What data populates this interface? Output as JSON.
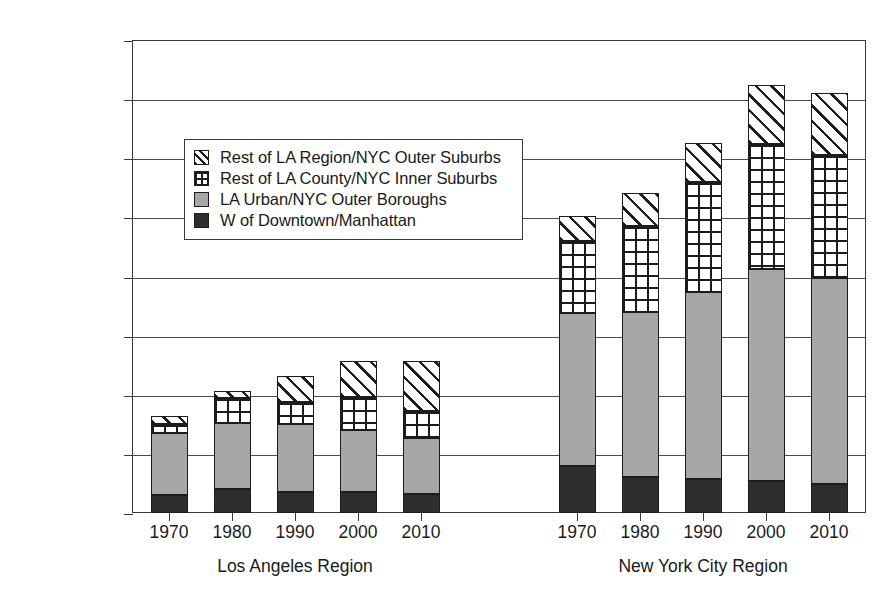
{
  "chart_data": {
    "type": "bar",
    "subtype": "stacked",
    "title": "",
    "xlabel": "",
    "ylabel": "",
    "ylim": [
      0,
      4000000
    ],
    "ytick_values": [
      0,
      500000,
      1000000,
      1500000,
      2000000,
      2500000,
      3000000,
      3500000,
      4000000
    ],
    "ytick_labels": [
      "0",
      "500,000",
      "1,000,000",
      "1,500,000",
      "2,000,000",
      "2,500,000",
      "3,000,000",
      "3,500,000",
      "4,000,000"
    ],
    "grid": true,
    "grid_axis": "y",
    "legend_position": "upper-left-inside",
    "categories": [
      "1970",
      "1980",
      "1990",
      "2000",
      "2010"
    ],
    "groups": [
      {
        "name": "Los Angeles Region",
        "categories": [
          "1970",
          "1980",
          "1990",
          "2000",
          "2010"
        ]
      },
      {
        "name": "New York City Region",
        "categories": [
          "1970",
          "1980",
          "1990",
          "2000",
          "2010"
        ]
      }
    ],
    "series": [
      {
        "name": "W of Downtown/Manhattan",
        "pattern": "solid-dark",
        "color": "#2e2e2e",
        "values": {
          "Los Angeles Region": [
            152000,
            203000,
            178000,
            178000,
            161000
          ],
          "New York City Region": [
            398000,
            305000,
            288000,
            271000,
            246000
          ]
        }
      },
      {
        "name": "LA Urban/NYC Outer Boroughs",
        "pattern": "solid-gray",
        "color": "#a6a6a6",
        "values": {
          "Los Angeles Region": [
            525000,
            558000,
            576000,
            524000,
            474000
          ],
          "New York City Region": [
            1292000,
            1397000,
            1584000,
            1796000,
            1742000
          ]
        }
      },
      {
        "name": "Rest of LA County/NYC Inner Suburbs",
        "pattern": "cross-hatch",
        "color": "#ffffff",
        "values": {
          "Los Angeles Region": [
            76000,
            212000,
            186000,
            280000,
            229000
          ],
          "New York City Region": [
            610000,
            729000,
            923000,
            1050000,
            1042000
          ]
        }
      },
      {
        "name": "Rest of LA Region/NYC Outer Suburbs",
        "pattern": "diagonal-hatch",
        "color": "#ffffff",
        "values": {
          "Los Angeles Region": [
            68000,
            59000,
            220000,
            305000,
            423000
          ],
          "New York City Region": [
            212000,
            271000,
            338000,
            499000,
            525000
          ]
        }
      }
    ],
    "totals": {
      "Los Angeles Region": [
        821000,
        1032000,
        1160000,
        1287000,
        1287000
      ],
      "New York City Region": [
        2512000,
        2702000,
        3133000,
        3616000,
        3555000
      ]
    }
  },
  "legend": {
    "items": [
      {
        "label": "Rest of LA Region/NYC Outer Suburbs",
        "pattern": "diagonal-hatch"
      },
      {
        "label": "Rest of LA County/NYC Inner Suburbs",
        "pattern": "cross-hatch"
      },
      {
        "label": "LA Urban/NYC Outer Boroughs",
        "pattern": "solid-gray"
      },
      {
        "label": "W of Downtown/Manhattan",
        "pattern": "solid-dark"
      }
    ]
  }
}
